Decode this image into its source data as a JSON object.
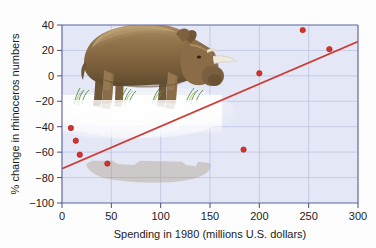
{
  "chart_data": {
    "type": "scatter",
    "title": "",
    "xlabel": "Spending in 1980 (millions U.S. dollars)",
    "ylabel": "% change in rhinoceros numbers",
    "xlim": [
      0,
      300
    ],
    "ylim": [
      -100,
      40
    ],
    "xticks": [
      0,
      50,
      100,
      150,
      200,
      250,
      300
    ],
    "yticks": [
      -100,
      -80,
      -60,
      -40,
      -20,
      0,
      20,
      40
    ],
    "xtick_labels": [
      "0",
      "50",
      "100",
      "150",
      "200",
      "250",
      "300"
    ],
    "ytick_labels": [
      "−100",
      "−80",
      "−60",
      "−40",
      "−20",
      "0",
      "20",
      "40"
    ],
    "grid": true,
    "legend": null,
    "points": [
      {
        "x": 9,
        "y": -41
      },
      {
        "x": 14,
        "y": -51
      },
      {
        "x": 18,
        "y": -62
      },
      {
        "x": 46,
        "y": -69
      },
      {
        "x": 184,
        "y": -58
      },
      {
        "x": 200,
        "y": 2
      },
      {
        "x": 244,
        "y": 36
      },
      {
        "x": 271,
        "y": 21
      }
    ],
    "trend_line": {
      "x0": 0,
      "y0": -73,
      "x1": 300,
      "y1": 27
    },
    "annotations": [
      {
        "name": "rhinoceros-illustration",
        "description": "Illustration of a grazing rhinoceros with grass and misty reflection, overlaid on upper-left of plot area"
      }
    ],
    "colors": {
      "plot_background": "#e4e7f6",
      "grid": "#b9bfe0",
      "axis": "#6e74a8",
      "point": "#d5342c",
      "trend_line": "#cf3b33",
      "text": "#1b1b1b"
    }
  },
  "axes": {
    "x_title": "Spending in 1980 (millions U.S. dollars)",
    "y_title": "% change in rhinoceros numbers"
  }
}
